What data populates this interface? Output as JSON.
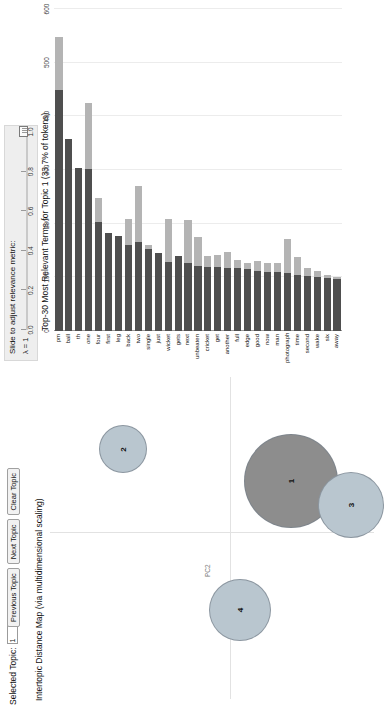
{
  "toolbar": {
    "selected_topic_label": "Selected Topic:",
    "selected_topic_value": "1",
    "previous_topic_label": "Previous Topic",
    "next_topic_label": "Next Topic",
    "clear_topic_label": "Clear Topic"
  },
  "slider": {
    "title": "Slide to adjust relevance metric:",
    "superscript": "(2)",
    "lambda_label": "λ = 1",
    "ticks": [
      "0.0",
      "0.2",
      "0.4",
      "0.6",
      "0.8",
      "1.0"
    ],
    "value": 1.0
  },
  "colors": {
    "bar_overall": "#b4b4b4",
    "bar_topic": "#4f4f4f",
    "bubble_fill": "#b9c6cf",
    "bubble_selected": "#8d8d8d",
    "panel_bg": "#eeeeee",
    "grid": "#ececec"
  },
  "chart_data": [
    {
      "type": "scatter",
      "name": "intertopic-distance-map",
      "title": "Intertopic Distance Map (via multidimensional scaling)",
      "xlabel": "PC1",
      "ylabel": "PC2",
      "grid": false,
      "legend": "none",
      "points": [
        {
          "label": "1",
          "x": 0.34,
          "y": -0.4,
          "size": 47
        },
        {
          "label": "2",
          "x": 0.55,
          "y": 0.72,
          "size": 24
        },
        {
          "label": "3",
          "x": 0.18,
          "y": -0.8,
          "size": 33
        },
        {
          "label": "4",
          "x": -0.52,
          "y": -0.06,
          "size": 31
        }
      ]
    },
    {
      "type": "bar",
      "name": "top-terms-bar-chart",
      "title": "Top-30 Most Relevant Terms for Topic 1 (33.7% of tokens)",
      "orientation": "horizontal",
      "xlabel": "",
      "ylabel": "",
      "xlim": [
        0,
        600
      ],
      "xticks": [
        0,
        100,
        200,
        300,
        400,
        500,
        600
      ],
      "grid": true,
      "legend_entries": [
        "Overall term frequency",
        "Estimated term frequency within the selected topic"
      ],
      "categories": [
        "pm",
        "ball",
        "th",
        "one",
        "four",
        "first",
        "leg",
        "back",
        "two",
        "single",
        "just",
        "wicket",
        "gets",
        "next",
        "unbeaten",
        "cricket",
        "get",
        "another",
        "full",
        "edge",
        "good",
        "now",
        "man",
        "photograph",
        "time",
        "second",
        "wake",
        "six",
        "away"
      ],
      "series": [
        {
          "name": "Overall term frequency",
          "values": [
            548,
            358,
            303,
            424,
            248,
            183,
            177,
            208,
            270,
            161,
            145,
            208,
            139,
            207,
            175,
            139,
            142,
            147,
            132,
            126,
            130,
            126,
            126,
            171,
            137,
            118,
            112,
            104,
            100
          ]
        },
        {
          "name": "Estimated term frequency within the selected topic",
          "values": [
            449,
            358,
            303,
            301,
            203,
            183,
            177,
            160,
            165,
            152,
            145,
            128,
            139,
            126,
            122,
            120,
            119,
            117,
            117,
            115,
            112,
            110,
            110,
            108,
            105,
            103,
            101,
            99,
            96
          ]
        }
      ]
    }
  ]
}
